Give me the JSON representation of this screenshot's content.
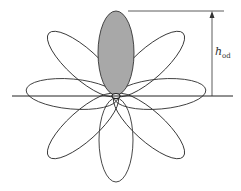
{
  "diagram": {
    "type": "radiation-pattern-petals",
    "petal_count": 8,
    "highlighted_petal": "top",
    "colors": {
      "stroke": "#333333",
      "highlight_fill": "#a8a8a8",
      "background": "#ffffff"
    },
    "dimension_label": {
      "main": "h",
      "subscript": "od"
    }
  }
}
